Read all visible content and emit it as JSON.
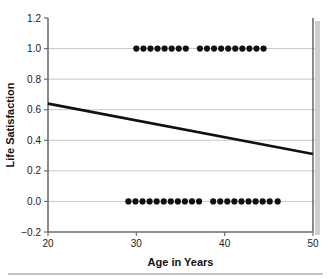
{
  "chart_data": {
    "type": "scatter",
    "title": "",
    "xlabel": "Age in Years",
    "ylabel": "Life Satisfaction",
    "xlim": [
      20,
      50
    ],
    "ylim": [
      -0.2,
      1.2
    ],
    "xticks": [
      20,
      30,
      40,
      50
    ],
    "xtick_labels": [
      "20",
      "30",
      "40",
      "50"
    ],
    "yticks": [
      -0.2,
      0.0,
      0.2,
      0.4,
      0.6,
      0.8,
      1.0,
      1.2
    ],
    "ytick_labels": [
      "−0.2",
      "0.0",
      "0.2",
      "0.4",
      "0.6",
      "0.8",
      "1.0",
      "1.2"
    ],
    "grid": "horizontal",
    "legend": "none",
    "marker": "filled-circle",
    "marker_color": "#111111",
    "points": [
      {
        "x": 30.0,
        "y": 1.0
      },
      {
        "x": 30.8,
        "y": 1.0
      },
      {
        "x": 31.6,
        "y": 1.0
      },
      {
        "x": 32.4,
        "y": 1.0
      },
      {
        "x": 33.2,
        "y": 1.0
      },
      {
        "x": 34.0,
        "y": 1.0
      },
      {
        "x": 34.8,
        "y": 1.0
      },
      {
        "x": 35.6,
        "y": 1.0
      },
      {
        "x": 37.2,
        "y": 1.0
      },
      {
        "x": 38.0,
        "y": 1.0
      },
      {
        "x": 38.8,
        "y": 1.0
      },
      {
        "x": 39.6,
        "y": 1.0
      },
      {
        "x": 40.4,
        "y": 1.0
      },
      {
        "x": 41.2,
        "y": 1.0
      },
      {
        "x": 42.0,
        "y": 1.0
      },
      {
        "x": 42.8,
        "y": 1.0
      },
      {
        "x": 43.6,
        "y": 1.0
      },
      {
        "x": 44.4,
        "y": 1.0
      },
      {
        "x": 29.1,
        "y": 0.0
      },
      {
        "x": 29.9,
        "y": 0.0
      },
      {
        "x": 30.7,
        "y": 0.0
      },
      {
        "x": 31.5,
        "y": 0.0
      },
      {
        "x": 32.3,
        "y": 0.0
      },
      {
        "x": 33.1,
        "y": 0.0
      },
      {
        "x": 33.9,
        "y": 0.0
      },
      {
        "x": 34.7,
        "y": 0.0
      },
      {
        "x": 35.5,
        "y": 0.0
      },
      {
        "x": 36.3,
        "y": 0.0
      },
      {
        "x": 37.1,
        "y": 0.0
      },
      {
        "x": 38.7,
        "y": 0.0
      },
      {
        "x": 39.5,
        "y": 0.0
      },
      {
        "x": 40.3,
        "y": 0.0
      },
      {
        "x": 41.1,
        "y": 0.0
      },
      {
        "x": 41.9,
        "y": 0.0
      },
      {
        "x": 42.7,
        "y": 0.0
      },
      {
        "x": 43.5,
        "y": 0.0
      },
      {
        "x": 44.3,
        "y": 0.0
      },
      {
        "x": 45.1,
        "y": 0.0
      },
      {
        "x": 46.0,
        "y": 0.0
      }
    ],
    "trendline": {
      "name": "regression-line",
      "x": [
        20,
        50
      ],
      "y": [
        0.64,
        0.31
      ],
      "color": "#111111"
    }
  }
}
